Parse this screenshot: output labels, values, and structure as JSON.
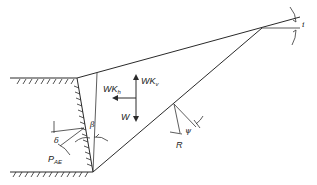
{
  "diagram": {
    "labels": {
      "wkv": "WK",
      "wkv_sub": "v",
      "wkh": "WK",
      "wkh_sub": "h",
      "w": "W",
      "beta": "β",
      "delta": "δ",
      "pae": "P",
      "pae_sub": "AE",
      "psi": "ψ",
      "r": "R",
      "i": "i"
    },
    "colors": {
      "line": "#2a2a2a",
      "background": "#ffffff"
    }
  }
}
